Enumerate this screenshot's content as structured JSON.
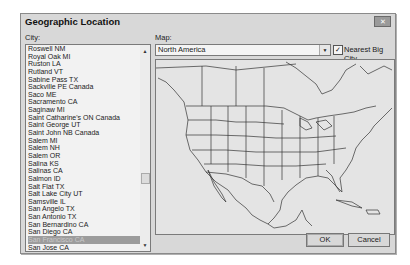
{
  "dialog": {
    "title": "Geographic Location",
    "close_icon": "close-icon"
  },
  "city": {
    "label": "City:",
    "items": [
      "Roswell NM",
      "Royal Oak MI",
      "Ruston LA",
      "Rutland VT",
      "Sabine Pass TX",
      "Sackville PE Canada",
      "Saco ME",
      "Sacramento CA",
      "Saginaw MI",
      "Saint Catharine's ON Canada",
      "Saint George UT",
      "Saint John NB Canada",
      "Salem MI",
      "Salem NH",
      "Salem OR",
      "Salina KS",
      "Salinas CA",
      "Salmon ID",
      "Salt Flat TX",
      "Salt Lake City UT",
      "Samsville IL",
      "San Angelo TX",
      "San Antonio TX",
      "San Bernardino CA",
      "San Diego CA",
      "San Francisco CA",
      "San Jose CA"
    ],
    "selected": "San Francisco CA"
  },
  "map": {
    "label": "Map:",
    "selected": "North America",
    "nearest_big_city_label": "Nearest Big City",
    "nearest_big_city_checked": true
  },
  "buttons": {
    "ok": "OK",
    "cancel": "Cancel"
  }
}
